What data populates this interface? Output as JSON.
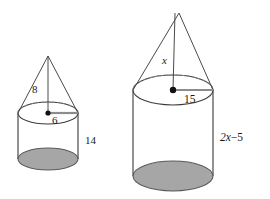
{
  "figure": {
    "background_color": "#ffffff",
    "stroke_color": "#3a3a3a",
    "shade_color": "#a6a6a6",
    "radius_marker_color": "#8c8c8c",
    "solids": [
      {
        "name": "left-solid",
        "description": "Smaller cone atop cylinder",
        "labels": {
          "slant_height": "8",
          "radius": "6",
          "cylinder_height": "14"
        }
      },
      {
        "name": "right-solid",
        "description": "Larger cone atop cylinder",
        "labels": {
          "cone_height": "x",
          "radius": "15",
          "cylinder_height": "2x−5"
        }
      }
    ]
  }
}
